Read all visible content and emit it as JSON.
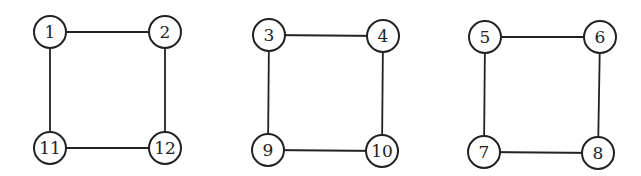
{
  "diagram": {
    "type": "graph",
    "style": {
      "stroke": "#222222",
      "fill": "#ffffff",
      "node_radius": 16
    },
    "components": [
      {
        "name": "cycle-a",
        "nodes": [
          {
            "id": "1",
            "label": "1",
            "x": 50,
            "y": 32
          },
          {
            "id": "2",
            "label": "2",
            "x": 165,
            "y": 32
          },
          {
            "id": "11",
            "label": "11",
            "x": 50,
            "y": 148
          },
          {
            "id": "12",
            "label": "12",
            "x": 165,
            "y": 148
          }
        ],
        "edges": [
          [
            "1",
            "2"
          ],
          [
            "1",
            "11"
          ],
          [
            "2",
            "12"
          ],
          [
            "11",
            "12"
          ]
        ]
      },
      {
        "name": "cycle-b",
        "nodes": [
          {
            "id": "3",
            "label": "3",
            "x": 269,
            "y": 35
          },
          {
            "id": "4",
            "label": "4",
            "x": 383,
            "y": 36
          },
          {
            "id": "9",
            "label": "9",
            "x": 268,
            "y": 150
          },
          {
            "id": "10",
            "label": "10",
            "x": 382,
            "y": 151
          }
        ],
        "edges": [
          [
            "3",
            "4"
          ],
          [
            "3",
            "9"
          ],
          [
            "4",
            "10"
          ],
          [
            "9",
            "10"
          ]
        ]
      },
      {
        "name": "cycle-c",
        "nodes": [
          {
            "id": "5",
            "label": "5",
            "x": 485,
            "y": 37
          },
          {
            "id": "6",
            "label": "6",
            "x": 600,
            "y": 37
          },
          {
            "id": "7",
            "label": "7",
            "x": 484,
            "y": 152
          },
          {
            "id": "8",
            "label": "8",
            "x": 598,
            "y": 153
          }
        ],
        "edges": [
          [
            "5",
            "6"
          ],
          [
            "5",
            "7"
          ],
          [
            "6",
            "8"
          ],
          [
            "7",
            "8"
          ]
        ]
      }
    ]
  }
}
